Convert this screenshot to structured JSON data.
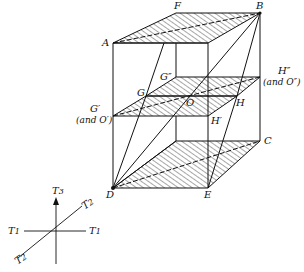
{
  "diagram": {
    "type": "3D box with stacked hatched planes and coordinate axes",
    "vertex_labels": {
      "A": "A",
      "B": "B",
      "C": "C",
      "D": "D",
      "E": "E",
      "F": "F",
      "G": "G",
      "H": "H",
      "O": "O",
      "G_prime": "G′",
      "G_prime_note": "(and O′)",
      "G_dprime": "G″",
      "H_prime": "H′",
      "H_dprime": "H″",
      "H_dprime_note": "(and O″)"
    },
    "axes": {
      "vertical": "T",
      "vertical_sub": "3",
      "horizontal_left": "T",
      "horizontal_left_sub": "1",
      "horizontal_right": "T",
      "horizontal_right_sub": "1",
      "diagonal_upper": "T",
      "diagonal_upper_sub": "2",
      "diagonal_lower": "T",
      "diagonal_lower_sub": "2"
    },
    "colors": {
      "ink": "#111111",
      "background": "#ffffff"
    }
  }
}
